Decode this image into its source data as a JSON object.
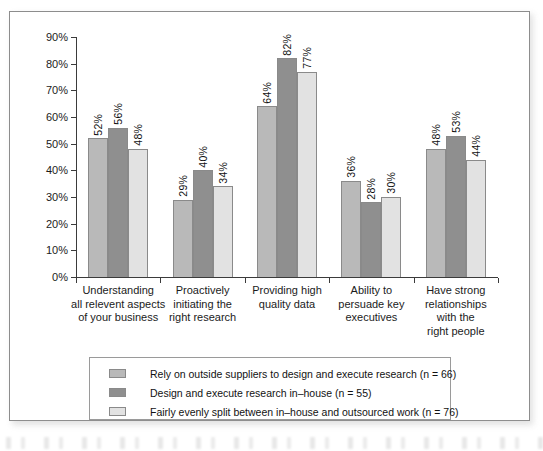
{
  "chart_data": {
    "type": "bar",
    "title": "",
    "subtitle": "",
    "xlabel": "",
    "ylabel": "",
    "ylim": [
      0,
      90
    ],
    "ytick_labels": [
      "0%",
      "10%",
      "20%",
      "30%",
      "40%",
      "50%",
      "60%",
      "70%",
      "80%",
      "90%"
    ],
    "ytick_values": [
      0,
      10,
      20,
      30,
      40,
      50,
      60,
      70,
      80,
      90
    ],
    "grid": false,
    "legend_position": "bottom",
    "value_label_rotation": "vertical",
    "categories": [
      "Understanding\nall relevent aspects\nof your business",
      "Proactively\ninitiating the\nright research",
      "Providing high\nquality data",
      "Ability to\npersuade key\nexecutives",
      "Have strong\nrelationships\nwith the\nright people"
    ],
    "category_lines": [
      [
        "Understanding",
        "all relevent aspects",
        "of your business"
      ],
      [
        "Proactively",
        "initiating the",
        "right research"
      ],
      [
        "Providing high",
        "quality data"
      ],
      [
        "Ability to",
        "persuade key",
        "executives"
      ],
      [
        "Have strong",
        "relationships",
        "with the",
        "right people"
      ]
    ],
    "series": [
      {
        "name": "Rely on outside suppliers to design and execute research (n = 66)",
        "color": "#b9b9b9",
        "values": [
          52,
          29,
          64,
          36,
          48
        ],
        "value_labels": [
          "52%",
          "29%",
          "64%",
          "36%",
          "48%"
        ]
      },
      {
        "name": "Design and execute research in–house (n = 55)",
        "color": "#8f8f8f",
        "values": [
          56,
          40,
          82,
          28,
          53
        ],
        "value_labels": [
          "56%",
          "40%",
          "82%",
          "28%",
          "53%"
        ]
      },
      {
        "name": "Fairly evenly split between in–house and outsourced work (n = 76)",
        "color": "#e2e2e2",
        "values": [
          48,
          34,
          77,
          30,
          44
        ],
        "value_labels": [
          "48%",
          "34%",
          "77%",
          "30%",
          "44%"
        ]
      }
    ]
  },
  "legend": {
    "items": [
      {
        "label": "Rely on outside suppliers to design and execute research (n = 66)",
        "swatch": "#b9b9b9"
      },
      {
        "label": "Design and execute research in–house (n = 55)",
        "swatch": "#8f8f8f"
      },
      {
        "label": "Fairly evenly split between in–house and outsourced work (n = 76)",
        "swatch": "#e2e2e2"
      }
    ]
  },
  "colors": {
    "series_1": "#b9b9b9",
    "series_2": "#8f8f8f",
    "series_3": "#e2e2e2",
    "axis": "#3b3b3b",
    "frame": "#8d8d8d",
    "text": "#1b1b1b"
  }
}
